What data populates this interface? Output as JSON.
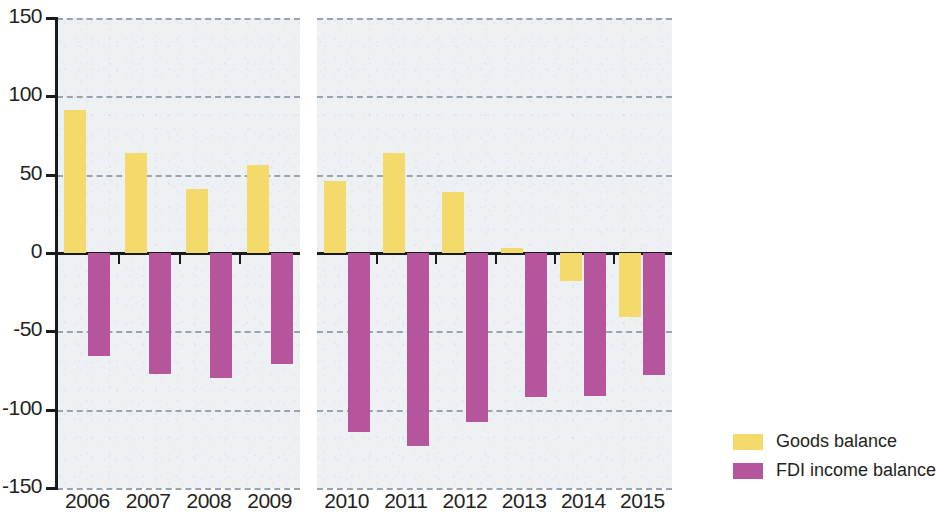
{
  "chart_data": {
    "type": "bar",
    "title": "",
    "subtitle": "",
    "xlabel": "",
    "ylabel": "",
    "ylim": [
      -150,
      150
    ],
    "yticks": [
      150,
      100,
      50,
      0,
      -50,
      -100,
      -150
    ],
    "ytick_labels": [
      "150",
      "100",
      "50",
      "0",
      "-50",
      "-100",
      "-150"
    ],
    "grid": true,
    "grid_style": "dashed-horizontal",
    "legend_position": "right",
    "panels": [
      {
        "name": "panel-1",
        "categories": [
          "2006",
          "2007",
          "2008",
          "2009"
        ]
      },
      {
        "name": "panel-2",
        "categories": [
          "2010",
          "2011",
          "2012",
          "2013",
          "2014",
          "2015"
        ]
      }
    ],
    "categories": [
      "2006",
      "2007",
      "2008",
      "2009",
      "2010",
      "2011",
      "2012",
      "2013",
      "2014",
      "2015"
    ],
    "series": [
      {
        "name": "Goods balance",
        "color": "#f3da6b",
        "values": [
          91,
          64,
          41,
          56,
          46,
          64,
          39,
          3,
          -18,
          -41
        ]
      },
      {
        "name": "FDI income balance",
        "color": "#b5559b",
        "values": [
          -66,
          -77,
          -80,
          -71,
          -114,
          -123,
          -108,
          -92,
          -91,
          -78
        ]
      }
    ]
  },
  "legend": {
    "items": [
      {
        "label": "Goods balance",
        "key": "goods"
      },
      {
        "label": "FDI income balance",
        "key": "fdi"
      }
    ]
  },
  "axis": {
    "zero_value": 0
  }
}
